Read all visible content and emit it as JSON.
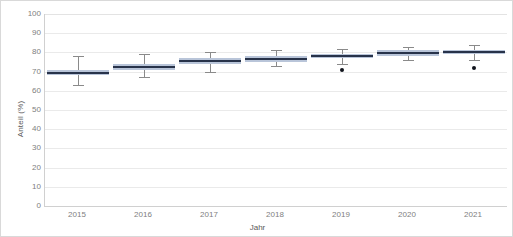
{
  "chart_data": {
    "type": "boxplot",
    "title": "",
    "xlabel": "Jahr",
    "ylabel": "Anteil (%)",
    "ylim": [
      0,
      100
    ],
    "ytick_labels": [
      "100",
      "90",
      "80",
      "70",
      "60",
      "50",
      "40",
      "30",
      "20",
      "10",
      "0"
    ],
    "ytick_values": [
      100,
      90,
      80,
      70,
      60,
      50,
      40,
      30,
      20,
      10,
      0
    ],
    "grid": true,
    "grid_axis": "y",
    "legend": false,
    "categories": [
      "2015",
      "2016",
      "2017",
      "2018",
      "2019",
      "2020",
      "2021"
    ],
    "boxes": [
      {
        "category": "2015",
        "whisker_low": 63,
        "q1": 68,
        "median": 69.5,
        "q3": 71,
        "whisker_high": 78,
        "outliers": []
      },
      {
        "category": "2016",
        "whisker_low": 67,
        "q1": 71,
        "median": 72.5,
        "q3": 74,
        "whisker_high": 79,
        "outliers": []
      },
      {
        "category": "2017",
        "whisker_low": 70,
        "q1": 74,
        "median": 75.5,
        "q3": 77,
        "whisker_high": 80,
        "outliers": []
      },
      {
        "category": "2018",
        "whisker_low": 73,
        "q1": 75,
        "median": 76.5,
        "q3": 78,
        "whisker_high": 81,
        "outliers": []
      },
      {
        "category": "2019",
        "whisker_low": 74,
        "q1": 77,
        "median": 78,
        "q3": 79,
        "whisker_high": 82,
        "outliers": [
          71
        ]
      },
      {
        "category": "2020",
        "whisker_low": 76,
        "q1": 78,
        "median": 79.5,
        "q3": 81,
        "whisker_high": 83,
        "outliers": []
      },
      {
        "category": "2021",
        "whisker_low": 76,
        "q1": 79,
        "median": 80,
        "q3": 81,
        "whisker_high": 84,
        "outliers": [
          72
        ]
      }
    ],
    "colors": {
      "box_fill": "#b9c5d9",
      "median": "#28334a",
      "whisker": "#8a8a8a",
      "outlier": "#10131c",
      "gridline": "#eaeaea",
      "axis": "#d0d0d0",
      "tick_text": "#808080",
      "axis_title_text": "#595959",
      "background": "#ffffff"
    }
  }
}
